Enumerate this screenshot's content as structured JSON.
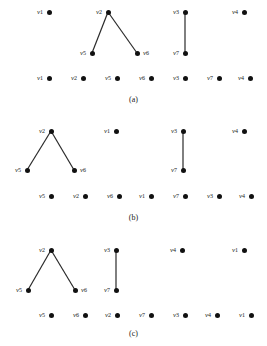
{
  "figure": {
    "width": 267,
    "height": 346,
    "background": "#ffffff",
    "node_color": "#111111",
    "edge_color": "#2a2a2a",
    "label_color": "#1a1a1a"
  },
  "panels": [
    {
      "id": "panel-a",
      "caption": "(a)",
      "caption_x": 133,
      "caption_y": 100,
      "upper_nodes": [
        {
          "id": "a-v1",
          "label": "v",
          "sub": "1",
          "x": 49,
          "y": 12,
          "label_side": "left"
        },
        {
          "id": "a-v2",
          "label": "v",
          "sub": "2",
          "x": 108,
          "y": 12,
          "label_side": "left"
        },
        {
          "id": "a-v5",
          "label": "v",
          "sub": "5",
          "x": 92,
          "y": 53,
          "label_side": "left"
        },
        {
          "id": "a-v6",
          "label": "v",
          "sub": "6",
          "x": 137,
          "y": 53,
          "label_side": "right"
        },
        {
          "id": "a-v3",
          "label": "v",
          "sub": "3",
          "x": 185,
          "y": 12,
          "label_side": "left"
        },
        {
          "id": "a-v7",
          "label": "v",
          "sub": "7",
          "x": 185,
          "y": 53,
          "label_side": "left"
        },
        {
          "id": "a-v4",
          "label": "v",
          "sub": "4",
          "x": 244,
          "y": 12,
          "label_side": "left"
        }
      ],
      "edges": [
        {
          "from": "a-v2",
          "to": "a-v5"
        },
        {
          "from": "a-v2",
          "to": "a-v6"
        },
        {
          "from": "a-v3",
          "to": "a-v7"
        }
      ],
      "bottom_nodes": [
        {
          "id": "a-b1",
          "label": "v",
          "sub": "1",
          "x": 49,
          "y": 78
        },
        {
          "id": "a-b2",
          "label": "v",
          "sub": "2",
          "x": 83,
          "y": 78
        },
        {
          "id": "a-b3",
          "label": "v",
          "sub": "5",
          "x": 117,
          "y": 78
        },
        {
          "id": "a-b4",
          "label": "v",
          "sub": "6",
          "x": 151,
          "y": 78
        },
        {
          "id": "a-b5",
          "label": "v",
          "sub": "3",
          "x": 185,
          "y": 78
        },
        {
          "id": "a-b6",
          "label": "v",
          "sub": "7",
          "x": 219,
          "y": 78
        },
        {
          "id": "a-b7",
          "label": "v",
          "sub": "4",
          "x": 250,
          "y": 78
        }
      ]
    },
    {
      "id": "panel-b",
      "caption": "(b)",
      "caption_x": 133,
      "caption_y": 218,
      "upper_nodes": [
        {
          "id": "b-v2",
          "label": "v",
          "sub": "2",
          "x": 51,
          "y": 131,
          "label_side": "left"
        },
        {
          "id": "b-v5",
          "label": "v",
          "sub": "5",
          "x": 27,
          "y": 170,
          "label_side": "left"
        },
        {
          "id": "b-v6",
          "label": "v",
          "sub": "6",
          "x": 74,
          "y": 170,
          "label_side": "right"
        },
        {
          "id": "b-v1",
          "label": "v",
          "sub": "1",
          "x": 116,
          "y": 131,
          "label_side": "left"
        },
        {
          "id": "b-v3",
          "label": "v",
          "sub": "3",
          "x": 183,
          "y": 131,
          "label_side": "left"
        },
        {
          "id": "b-v7",
          "label": "v",
          "sub": "7",
          "x": 183,
          "y": 170,
          "label_side": "left"
        },
        {
          "id": "b-v4",
          "label": "v",
          "sub": "4",
          "x": 244,
          "y": 131,
          "label_side": "left"
        }
      ],
      "edges": [
        {
          "from": "b-v2",
          "to": "b-v5"
        },
        {
          "from": "b-v2",
          "to": "b-v6"
        },
        {
          "from": "b-v3",
          "to": "b-v7"
        }
      ],
      "bottom_nodes": [
        {
          "id": "b-b1",
          "label": "v",
          "sub": "5",
          "x": 51,
          "y": 196
        },
        {
          "id": "b-b2",
          "label": "v",
          "sub": "2",
          "x": 85,
          "y": 196
        },
        {
          "id": "b-b3",
          "label": "v",
          "sub": "6",
          "x": 119,
          "y": 196
        },
        {
          "id": "b-b4",
          "label": "v",
          "sub": "1",
          "x": 151,
          "y": 196
        },
        {
          "id": "b-b5",
          "label": "v",
          "sub": "7",
          "x": 185,
          "y": 196
        },
        {
          "id": "b-b6",
          "label": "v",
          "sub": "3",
          "x": 219,
          "y": 196
        },
        {
          "id": "b-b7",
          "label": "v",
          "sub": "4",
          "x": 251,
          "y": 196
        }
      ]
    },
    {
      "id": "panel-c",
      "caption": "(c)",
      "caption_x": 133,
      "caption_y": 334,
      "upper_nodes": [
        {
          "id": "c-v2",
          "label": "v",
          "sub": "2",
          "x": 51,
          "y": 250,
          "label_side": "left"
        },
        {
          "id": "c-v5",
          "label": "v",
          "sub": "5",
          "x": 28,
          "y": 290,
          "label_side": "left"
        },
        {
          "id": "c-v6",
          "label": "v",
          "sub": "6",
          "x": 75,
          "y": 290,
          "label_side": "right"
        },
        {
          "id": "c-v3",
          "label": "v",
          "sub": "3",
          "x": 116,
          "y": 250,
          "label_side": "left"
        },
        {
          "id": "c-v7",
          "label": "v",
          "sub": "7",
          "x": 116,
          "y": 290,
          "label_side": "left"
        },
        {
          "id": "c-v4",
          "label": "v",
          "sub": "4",
          "x": 182,
          "y": 250,
          "label_side": "left"
        },
        {
          "id": "c-v1",
          "label": "v",
          "sub": "1",
          "x": 244,
          "y": 250,
          "label_side": "left"
        }
      ],
      "edges": [
        {
          "from": "c-v2",
          "to": "c-v5"
        },
        {
          "from": "c-v2",
          "to": "c-v6"
        },
        {
          "from": "c-v3",
          "to": "c-v7"
        }
      ],
      "bottom_nodes": [
        {
          "id": "c-b1",
          "label": "v",
          "sub": "5",
          "x": 51,
          "y": 315
        },
        {
          "id": "c-b2",
          "label": "v",
          "sub": "6",
          "x": 85,
          "y": 315
        },
        {
          "id": "c-b3",
          "label": "v",
          "sub": "2",
          "x": 117,
          "y": 315
        },
        {
          "id": "c-b4",
          "label": "v",
          "sub": "7",
          "x": 151,
          "y": 315
        },
        {
          "id": "c-b5",
          "label": "v",
          "sub": "3",
          "x": 185,
          "y": 315
        },
        {
          "id": "c-b6",
          "label": "v",
          "sub": "4",
          "x": 217,
          "y": 315
        },
        {
          "id": "c-b7",
          "label": "v",
          "sub": "1",
          "x": 251,
          "y": 315
        }
      ]
    }
  ]
}
